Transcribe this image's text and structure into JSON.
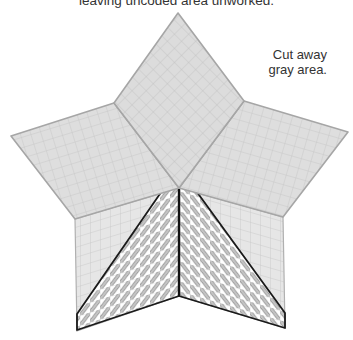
{
  "instructions": {
    "top_text": "leaving uncoded area unworked.",
    "note_line1": "Cut away",
    "note_line2": "gray area."
  },
  "diagram": {
    "panels": [
      {
        "name": "top-diamond",
        "state": "cut-away"
      },
      {
        "name": "left-diamond",
        "state": "cut-away"
      },
      {
        "name": "right-diamond",
        "state": "cut-away"
      },
      {
        "name": "lower-left-panel",
        "state": "partially-coded"
      },
      {
        "name": "lower-right-panel",
        "state": "partially-coded"
      }
    ],
    "colors": {
      "cut_area_fill": "#dcdcdc",
      "cut_area_edge": "#a9a9a9",
      "grid_line": "#c4c4c4",
      "lower_panel_fill": "#e4e4e4",
      "coded_outline": "#1a1a1a",
      "stitch_bar": "#bdbdbd",
      "stitch_bar_edge": "#8a8a8a"
    }
  }
}
